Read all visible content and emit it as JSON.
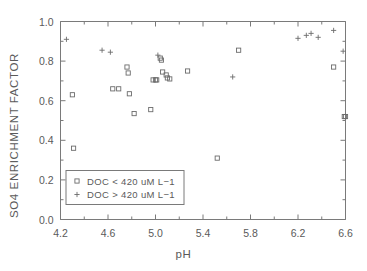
{
  "chart_data": {
    "type": "scatter",
    "title": "",
    "xlabel": "pH",
    "ylabel": "SO4 ENRICHMENT FACTOR",
    "xlim": [
      4.2,
      6.6
    ],
    "ylim": [
      0.0,
      1.0
    ],
    "xticks": [
      "4.2",
      "4.6",
      "5.0",
      "5.4",
      "5.8",
      "6.2",
      "6.6"
    ],
    "xtick_values": [
      4.2,
      4.6,
      5.0,
      5.4,
      5.8,
      6.2,
      6.6
    ],
    "xminor_values": [
      4.4,
      4.8,
      5.2,
      5.6,
      6.0,
      6.4
    ],
    "yticks": [
      "0.0",
      "0.2",
      "0.4",
      "0.6",
      "0.8",
      "1.0"
    ],
    "ytick_values": [
      0.0,
      0.2,
      0.4,
      0.6,
      0.8,
      1.0
    ],
    "yminor_values": [
      0.1,
      0.3,
      0.5,
      0.7,
      0.9
    ],
    "grid": false,
    "legend_position": "lower-left",
    "series": [
      {
        "name": "DOC < 420 uM L-1",
        "marker": "open-square",
        "color": "#6b6b6b",
        "points": [
          [
            4.3,
            0.63
          ],
          [
            4.31,
            0.36
          ],
          [
            4.64,
            0.66
          ],
          [
            4.69,
            0.66
          ],
          [
            4.76,
            0.77
          ],
          [
            4.77,
            0.74
          ],
          [
            4.78,
            0.635
          ],
          [
            4.82,
            0.535
          ],
          [
            4.96,
            0.555
          ],
          [
            4.98,
            0.705
          ],
          [
            5.0,
            0.705
          ],
          [
            5.01,
            0.705
          ],
          [
            5.04,
            0.815
          ],
          [
            5.05,
            0.805
          ],
          [
            5.06,
            0.745
          ],
          [
            5.09,
            0.73
          ],
          [
            5.1,
            0.715
          ],
          [
            5.12,
            0.71
          ],
          [
            5.27,
            0.75
          ],
          [
            5.52,
            0.31
          ],
          [
            5.7,
            0.855
          ],
          [
            6.5,
            0.77
          ],
          [
            6.59,
            0.52
          ],
          [
            6.6,
            0.52
          ]
        ]
      },
      {
        "name": "DOC > 420 uM L-1",
        "marker": "plus",
        "color": "#6b6b6b",
        "points": [
          [
            4.25,
            0.91
          ],
          [
            4.55,
            0.855
          ],
          [
            4.62,
            0.845
          ],
          [
            5.02,
            0.83
          ],
          [
            5.65,
            0.72
          ],
          [
            6.2,
            0.915
          ],
          [
            6.27,
            0.93
          ],
          [
            6.31,
            0.94
          ],
          [
            6.37,
            0.92
          ],
          [
            6.5,
            0.955
          ],
          [
            6.58,
            0.85
          ]
        ]
      }
    ]
  },
  "legend": {
    "entries": [
      {
        "marker": "open-square",
        "label": "DOC < 420 uM L−1"
      },
      {
        "marker": "plus",
        "label": "DOC > 420 uM L−1"
      }
    ]
  },
  "clipped_left_text": "",
  "colors": {
    "axis": "#7a7a7a",
    "marker": "#6b6b6b",
    "text": "#5a5a5a",
    "background": "#ffffff"
  }
}
